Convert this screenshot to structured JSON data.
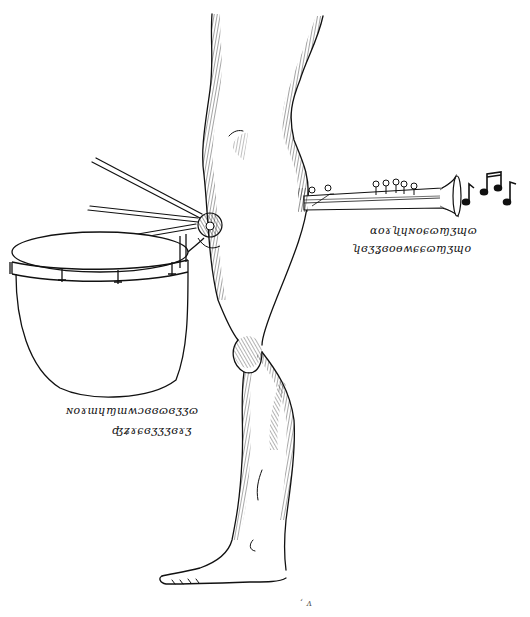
{
  "artwork": {
    "style": "pen-and-ink cross-hatched drawing",
    "background_color": "#ffffff",
    "ink_color": "#111111",
    "subject": "Single human leg with a bass drum and mallets attached at the hip and a clarinet protruding from the buttock, with musical notes emanating from the bell"
  },
  "elements": {
    "leg": {
      "label": "leg"
    },
    "drum": {
      "label": "bass drum",
      "mallet_count": 3
    },
    "clarinet": {
      "label": "clarinet"
    },
    "notes": {
      "glyphs": "♪ ♫ ♪"
    }
  },
  "captions": {
    "clarinet_line1": "ɑoɤʯɥɴoɕɷɱʒɰɷ",
    "clarinet_line2": "ʮɞʒʓɞoɵʍɕɕɷɱʒɰo",
    "drum_line1": "ɴoɤɯɥɱɯʍɔɞɞɷɞʒʒɷ",
    "drum_line2": "ʤʑɤɕɞʒʒʒɞɤʒ",
    "bottom_mark": "ʻ  ᴧ"
  }
}
